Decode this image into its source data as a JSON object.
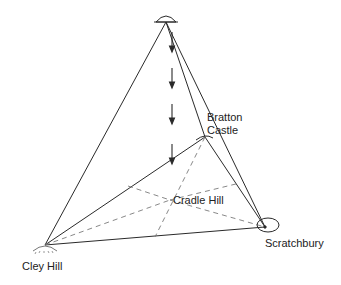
{
  "diagram": {
    "title": "",
    "colors": {
      "line": "#2a2a2a",
      "dashed": "#7a7a7a",
      "background": "#ffffff"
    },
    "nodes": [
      {
        "id": "ufo",
        "label": "",
        "icon": "ufo-icon",
        "x": 166,
        "y": 20
      },
      {
        "id": "bratton",
        "label_line1": "Bratton",
        "label_line2": "Castle",
        "x": 205,
        "y": 137
      },
      {
        "id": "cradle",
        "label": "Cradle Hill",
        "x": 170,
        "y": 200
      },
      {
        "id": "cley",
        "label": "Cley Hill",
        "x": 45,
        "y": 245
      },
      {
        "id": "scratchbury",
        "label": "Scratchbury",
        "x": 265,
        "y": 227
      }
    ],
    "labels": {
      "bratton_line1": "Bratton",
      "bratton_line2": "Castle",
      "cradle": "Cradle Hill",
      "cley": "Cley Hill",
      "scratchbury": "Scratchbury"
    },
    "edges_solid": [
      [
        "ufo",
        "cley"
      ],
      [
        "ufo",
        "scratchbury"
      ],
      [
        "ufo",
        "bratton"
      ],
      [
        "cley",
        "bratton"
      ],
      [
        "cley",
        "scratchbury"
      ],
      [
        "bratton",
        "scratchbury"
      ]
    ],
    "edges_dashed": [
      [
        "cley",
        "cradle"
      ],
      [
        "bratton",
        "cradle"
      ],
      [
        "cradle",
        "scratchbury"
      ]
    ],
    "arrows": "downward dashed arrows from UFO toward Cradle Hill"
  }
}
